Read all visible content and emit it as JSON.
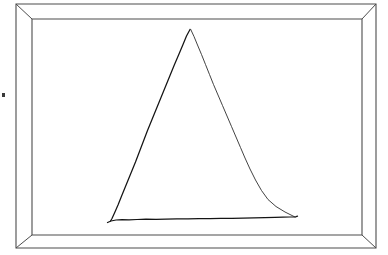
{
  "scene": {
    "title": "Hand-drawn triangle inside a picture frame",
    "description": "A line drawing of a rectangular picture frame with mitered corners. Inside the frame is a roughly sketched isosceles triangle drawn in pencil-like strokes.",
    "width": 388,
    "height": 255,
    "background_color": "#ffffff"
  },
  "frame": {
    "name": "picture-frame",
    "outer": {
      "left": 16,
      "top": 4,
      "right": 376,
      "bottom": 248
    },
    "inner": {
      "left": 32,
      "top": 19,
      "right": 362,
      "bottom": 235
    },
    "border_thickness_px": 15,
    "stroke_color": "#4d4d4d",
    "fill_color": "#ffffff",
    "corner_style": "mitered",
    "corners": [
      "top-left",
      "top-right",
      "bottom-right",
      "bottom-left"
    ]
  },
  "canvas": {
    "name": "frame-interior",
    "fill_color": "#ffffff",
    "left": 32,
    "top": 19,
    "right": 362,
    "bottom": 235
  },
  "drawing": {
    "name": "triangle-sketch",
    "shape": "triangle",
    "style": "hand-drawn",
    "stroke_color": "#141414",
    "stroke_width": 1.25,
    "vertices": {
      "apex": {
        "x": 190,
        "y": 29
      },
      "base_left": {
        "x": 110,
        "y": 221
      },
      "base_right": {
        "x": 295,
        "y": 217
      }
    },
    "paths": {
      "left_side": "M 190.0,29.5 L 186.5,36.0 L 183.0,44.5 L 179.0,54.0 L 174.5,64.5 L 170.0,75.5 L 165.5,86.5 L 161.0,97.5 L 156.5,108.5 L 152.0,119.5 L 147.5,130.5 L 143.5,141.0 L 139.5,151.5 L 135.5,162.0 L 131.0,173.0 L 126.5,184.0 L 122.0,195.0 L 118.0,205.0 L 114.5,213.0 L 112.0,218.5 L 110.5,221.0",
      "right_side": "M 190.6,29.2 L 194.0,36.5 L 197.5,45.0 L 201.5,54.5 L 205.5,64.5 L 209.5,74.5 L 213.5,84.5 L 218.0,95.0 L 222.5,105.5 L 227.0,116.0 L 231.5,126.5 L 236.0,137.0 L 240.5,147.5 L 245.0,158.0 L 250.0,169.0 L 255.5,180.0 L 261.5,190.5 L 268.0,199.5 L 276.0,206.5 L 285.0,212.0 L 292.0,215.5 L 295.0,217.0",
      "base": "M 107.5,222.5 L 111.0,221.0 L 116.0,220.0 L 122.0,219.6 L 129.0,219.8 L 137.0,219.5 L 146.0,219.2 L 156.0,219.4 L 166.0,219.2 L 177.0,218.9 L 188.0,218.9 L 199.0,218.7 L 210.0,218.6 L 221.0,218.4 L 232.0,218.3 L 243.0,218.1 L 254.0,217.9 L 265.0,217.7 L 275.0,217.4 L 283.0,217.2 L 290.0,217.0 L 295.5,216.8 L 297.5,216.2"
    }
  },
  "artifacts": [
    {
      "name": "dust-speck",
      "x": 2,
      "y": 93,
      "width": 3,
      "height": 4,
      "color": "#3a3a3a"
    }
  ]
}
